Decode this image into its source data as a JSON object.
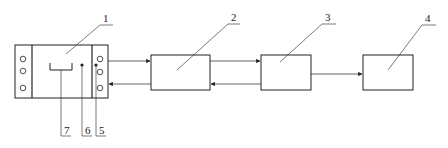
{
  "diagram": {
    "type": "patent-block-diagram",
    "labels": {
      "l1": "1",
      "l2": "2",
      "l3": "3",
      "l4": "4",
      "l5": "5",
      "l6": "6",
      "l7": "7"
    },
    "components": [
      {
        "id": "1",
        "description": "device housing with terminal strips"
      },
      {
        "id": "2",
        "description": "block 2"
      },
      {
        "id": "3",
        "description": "block 3"
      },
      {
        "id": "4",
        "description": "block 4"
      },
      {
        "id": "5",
        "description": "contact point (right)"
      },
      {
        "id": "6",
        "description": "contact point (middle)"
      },
      {
        "id": "7",
        "description": "bracket element"
      }
    ],
    "connections": [
      {
        "from": "1",
        "to": "2",
        "direction": "forward"
      },
      {
        "from": "2",
        "to": "1",
        "direction": "return"
      },
      {
        "from": "2",
        "to": "3",
        "direction": "forward"
      },
      {
        "from": "3",
        "to": "2",
        "direction": "return"
      },
      {
        "from": "3",
        "to": "4",
        "direction": "forward"
      }
    ],
    "colors": {
      "stroke": "#222222",
      "background": "#ffffff"
    }
  }
}
